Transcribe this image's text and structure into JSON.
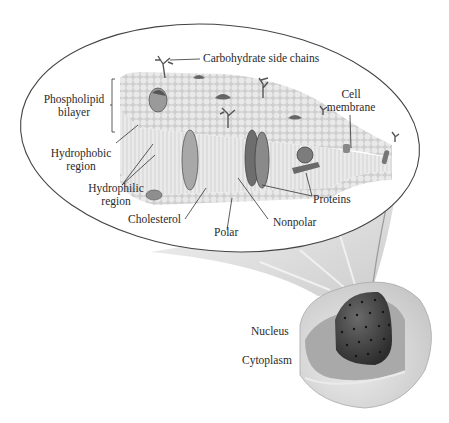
{
  "diagram": {
    "labels": {
      "carbohydrate": "Carbohydrate side chains",
      "phospholipid_l1": "Phospholipid",
      "phospholipid_l2": "bilayer",
      "cell_membrane_l1": "Cell",
      "cell_membrane_l2": "membrane",
      "hydrophobic_l1": "Hydrophobic",
      "hydrophobic_l2": "region",
      "hydrophilic_l1": "Hydrophilic",
      "hydrophilic_l2": "region",
      "proteins": "Proteins",
      "cholesterol": "Cholesterol",
      "polar": "Polar",
      "nonpolar": "Nonpolar",
      "nucleus": "Nucleus",
      "cytoplasm": "Cytoplasm"
    },
    "colors": {
      "outline": "#3a3a3a",
      "membrane_light": "#e2e2e2",
      "membrane_mid": "#c8c8c8",
      "protein": "#7a7a7a",
      "protein_dark": "#555555",
      "nucleus": "#3e3e3e",
      "cell_body": "#d4d4d4",
      "rays": "#dcdcdc"
    }
  }
}
